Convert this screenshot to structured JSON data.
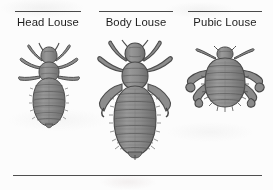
{
  "figure": {
    "name": "lice-comparison-figure",
    "background_color": "#fcfcfc",
    "rule_color": "#4a4a4a",
    "body_fill_color": "#8a8a8a",
    "body_outline_color": "#4a4a4a",
    "body_shadow_color": "#6d6d6d",
    "columns": [
      {
        "id": "head-louse",
        "label": "Head Louse",
        "illustration": "head-louse-illustration",
        "description": "Dorsal view of an elongated grayscale louse with narrow segmented abdomen, small head with antennae and three pairs of legs"
      },
      {
        "id": "body-louse",
        "label": "Body Louse",
        "illustration": "body-louse-illustration",
        "description": "Dorsal view of the largest louse with long heavily segmented abdomen, distinct head and three pairs of clawed legs"
      },
      {
        "id": "pubic-louse",
        "label": "Pubic Louse",
        "illustration": "pubic-louse-illustration",
        "description": "Dorsal view of a short broad crab-like louse with wide body and large grasping claws on the lateral legs"
      }
    ],
    "bottom_rule": "horizontal-divider"
  }
}
